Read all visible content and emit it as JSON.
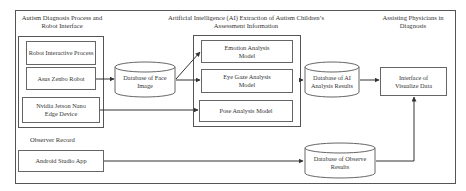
{
  "diagram": {
    "sections": {
      "autism_process": "Autism Diagnosis Process and Robot Interface",
      "ai_extraction": "Artificial Intelligence (AI) Extraction of Autism Children’s Assessment Information",
      "assisting": "Assisting Physicians in Diagnosis",
      "observer": "Observer Record"
    },
    "nodes": {
      "robot_interactive": "Robot Interactive Process",
      "asus_zenbo": "Asus Zenbo Robot",
      "nvidia_jetson": "Nvidia Jetson Nano Edge Device",
      "db_face": "Database of Face Image",
      "emotion": "Emotion Analysis Model",
      "eye_gaze": "Eye Gaze Analysis Model",
      "pose": "Pose Analysis Model",
      "db_ai": "Database of AI Analysis Results",
      "interface": "Interface of Visualize Data",
      "android": "Android Studio App",
      "db_observe": "Database of Observe Results"
    },
    "edges": [
      {
        "from": "asus_zenbo",
        "to": "db_face"
      },
      {
        "from": "db_face",
        "to": "emotion"
      },
      {
        "from": "db_face",
        "to": "eye_gaze"
      },
      {
        "from": "nvidia_jetson",
        "to": "pose"
      },
      {
        "from": "ai_group",
        "to": "db_ai"
      },
      {
        "from": "db_ai",
        "to": "interface"
      },
      {
        "from": "android",
        "to": "db_observe"
      },
      {
        "from": "db_observe",
        "to": "interface"
      }
    ],
    "colors": {
      "line": "#333333",
      "border": "#666666"
    }
  }
}
